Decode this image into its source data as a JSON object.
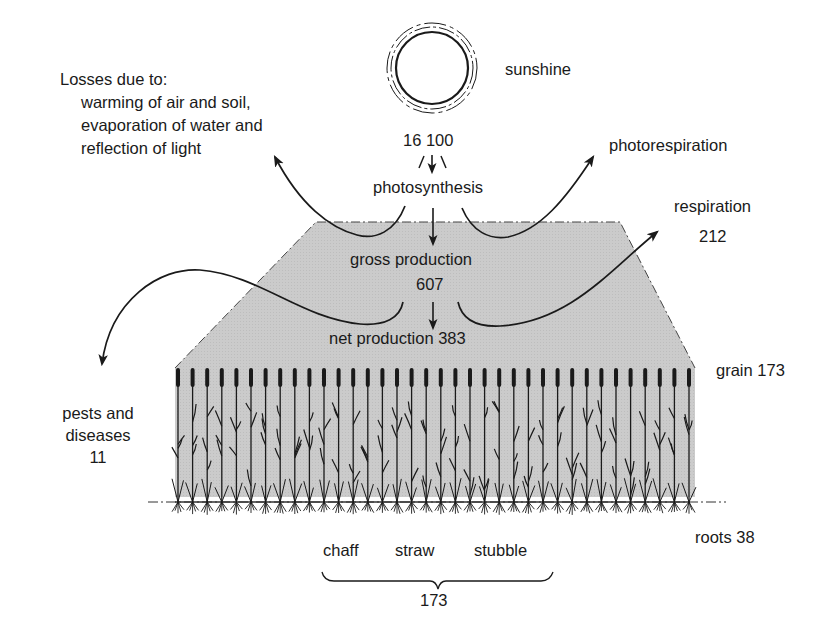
{
  "diagram": {
    "sun": {
      "label": "sunshine",
      "value": "16 100"
    },
    "losses": {
      "title": "Losses due to:",
      "lines": [
        "warming of air and soil,",
        "evaporation of water and",
        "reflection of light"
      ]
    },
    "photosynthesis": {
      "label": "photosynthesis"
    },
    "photorespiration": {
      "label": "photorespiration"
    },
    "respiration": {
      "label": "respiration",
      "value": "212"
    },
    "gross_production": {
      "label": "gross production",
      "value": "607"
    },
    "net_production": {
      "label": "net production 383"
    },
    "pests": {
      "line1": "pests and",
      "line2": "diseases",
      "value": "11"
    },
    "grain": {
      "label": "grain 173"
    },
    "roots": {
      "label": "roots 38"
    },
    "residues": {
      "items": [
        "chaff",
        "straw",
        "stubble"
      ],
      "total": "173"
    },
    "colors": {
      "ink": "#1a1a1a",
      "fill": "#c8c8c8",
      "background": "#ffffff"
    }
  }
}
